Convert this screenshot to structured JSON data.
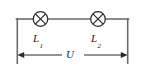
{
  "figure": {
    "kind": "circuit-diagram",
    "background_color": "#ffffff",
    "wire_color": "#6b6b6b",
    "symbol_color": "#2b2b2b",
    "label_color": "#1c1c1c"
  },
  "circuit": {
    "components": [
      {
        "id": "lamp1",
        "type": "lamp-crossed-circle",
        "label_main": "L",
        "label_sub": "1",
        "cx": 40.5,
        "cy": 19,
        "r": 7.5
      },
      {
        "id": "lamp2",
        "type": "lamp-crossed-circle",
        "label_main": "L",
        "label_sub": "2",
        "cx": 98,
        "cy": 19,
        "r": 7.5
      }
    ],
    "wires": [
      {
        "id": "left-riser",
        "x1": 17,
        "y1": 19,
        "x2": 17,
        "y2": 63
      },
      {
        "id": "top-left",
        "x1": 17,
        "y1": 19,
        "x2": 33,
        "y2": 19
      },
      {
        "id": "top-middle",
        "x1": 48,
        "y1": 19,
        "x2": 90.5,
        "y2": 19
      },
      {
        "id": "top-right",
        "x1": 105.5,
        "y1": 19,
        "x2": 128,
        "y2": 19
      },
      {
        "id": "right-riser",
        "x1": 128,
        "y1": 19,
        "x2": 128,
        "y2": 63
      }
    ]
  },
  "measurement": {
    "id": "voltage-span",
    "label": "U",
    "quantity": "voltage",
    "arrow_y": 55,
    "arrow_x_start": 17,
    "arrow_x_end": 128,
    "gap_x_start": 62,
    "gap_x_end": 84,
    "double_headed": true
  }
}
